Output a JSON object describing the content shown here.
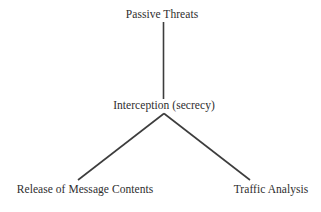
{
  "diagram": {
    "type": "tree",
    "orientation": "top-down",
    "background_color": "#ffffff",
    "line_color": "#3d3d3d",
    "text_color": "#2e2e2e",
    "nodes": {
      "root": {
        "label": "Passive Threats"
      },
      "middle": {
        "label": "Interception (secrecy)"
      },
      "leaf_left": {
        "label": "Release of Message Contents"
      },
      "leaf_right": {
        "label": "Traffic Analysis"
      }
    },
    "edges": [
      {
        "name": "root-to-middle",
        "from": "Passive Threats",
        "to": "Interception (secrecy)"
      },
      {
        "name": "middle-to-leaf-left",
        "from": "Interception (secrecy)",
        "to": "Release of Message Contents"
      },
      {
        "name": "middle-to-leaf-right",
        "from": "Interception (secrecy)",
        "to": "Traffic Analysis"
      }
    ]
  }
}
